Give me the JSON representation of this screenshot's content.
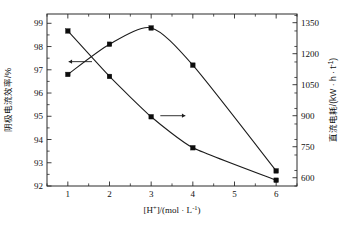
{
  "chart_data": {
    "type": "line",
    "title": "",
    "xlabel": "[H+]/(mol · L⁻¹)",
    "xlabel_parts": {
      "bracket_open": "[H",
      "plus": "+",
      "bracket_close": "]/(mol · L",
      "exp": "-1",
      "tail": ")"
    },
    "ylabel_left": "阴极电流效率/%",
    "ylabel_right": "直流电耗/(kW · h · t⁻¹)",
    "ylabel_right_parts": {
      "head": "直流电耗/(kW · h · t",
      "exp": "-1",
      "tail": ")"
    },
    "x": [
      1,
      2,
      3,
      4,
      6
    ],
    "xlim": [
      0.5,
      6.5
    ],
    "xticks": [
      1,
      2,
      3,
      4,
      5,
      6
    ],
    "xticklabels": [
      "1",
      "2",
      "3",
      "4",
      "5",
      "6"
    ],
    "x_minor_step": 0.5,
    "ylim_left": [
      92,
      99.4
    ],
    "yticks_left": [
      92,
      93,
      94,
      95,
      96,
      97,
      98,
      99
    ],
    "yticklabels_left": [
      "92",
      "93",
      "94",
      "95",
      "96",
      "97",
      "98",
      "99"
    ],
    "y_left_minor_step": 0.5,
    "ylim_right": [
      560,
      1392
    ],
    "yticks_right": [
      600,
      750,
      900,
      1050,
      1200,
      1350
    ],
    "yticklabels_right": [
      "600",
      "750",
      "900",
      "1050",
      "1200",
      "1350"
    ],
    "y_right_minor_step": 75,
    "grid": false,
    "legend": "none",
    "series": [
      {
        "name": "阴极电流效率",
        "axis": "left",
        "marker": "filled-square",
        "arrow_annotation": "left",
        "values": [
          96.8,
          98.1,
          98.8,
          97.2,
          92.65
        ]
      },
      {
        "name": "直流电耗",
        "axis": "right",
        "marker": "filled-square",
        "arrow_annotation": "right",
        "values": [
          1310,
          1090,
          895,
          745,
          588
        ]
      }
    ],
    "annotations": [
      {
        "name": "left-axis-arrow",
        "text": "←",
        "points_to": "阴极电流效率 curve"
      },
      {
        "name": "right-axis-arrow",
        "text": "→",
        "points_to": "直流电耗 curve"
      }
    ]
  }
}
